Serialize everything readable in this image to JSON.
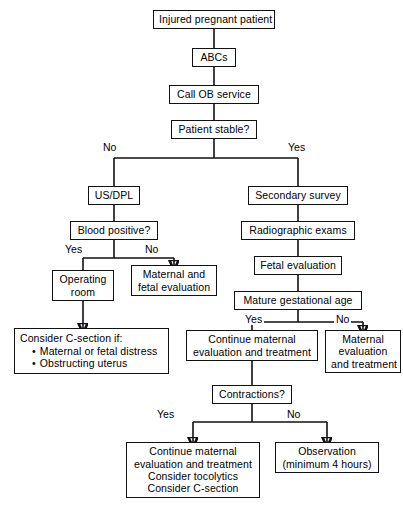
{
  "chart_data": {
    "type": "diagram",
    "orientation": "top-down",
    "background": "#ffffff",
    "line_color": "#111111",
    "nodes": [
      {
        "id": "injured",
        "label": "Injured pregnant patient",
        "lines": [
          "Injured pregnant patient"
        ],
        "x": 153,
        "y": 10,
        "w": 122,
        "h": 19
      },
      {
        "id": "abcs",
        "label": "ABCs",
        "lines": [
          "ABCs"
        ],
        "x": 192,
        "y": 48,
        "w": 44,
        "h": 19
      },
      {
        "id": "callob",
        "label": "Call OB service",
        "lines": [
          "Call OB service"
        ],
        "x": 169,
        "y": 85,
        "w": 90,
        "h": 19
      },
      {
        "id": "stable",
        "label": "Patient stable?",
        "lines": [
          "Patient stable?"
        ],
        "x": 171,
        "y": 120,
        "w": 86,
        "h": 19
      },
      {
        "id": "usdpl",
        "label": "US/DPL",
        "lines": [
          "US/DPL"
        ],
        "x": 88,
        "y": 186,
        "w": 52,
        "h": 19
      },
      {
        "id": "blood",
        "label": "Blood positive?",
        "lines": [
          "Blood positive?"
        ],
        "x": 70,
        "y": 221,
        "w": 88,
        "h": 19
      },
      {
        "id": "oproom",
        "label": "Operating room",
        "lines": [
          "Operating",
          "room"
        ],
        "x": 52,
        "y": 270,
        "w": 62,
        "h": 31
      },
      {
        "id": "matfet",
        "label": "Maternal and fetal evaluation",
        "lines": [
          "Maternal and",
          "fetal evaluation"
        ],
        "x": 131,
        "y": 265,
        "w": 86,
        "h": 31
      },
      {
        "id": "csection",
        "label": "Consider C-section if: Maternal or fetal distress; Obstructing uterus",
        "lines": [
          "Consider C-section if:"
        ],
        "bullets": [
          "Maternal or fetal distress",
          "Obstructing uterus"
        ],
        "x": 14,
        "y": 328,
        "w": 155,
        "h": 46
      },
      {
        "id": "secondary",
        "label": "Secondary survey",
        "lines": [
          "Secondary survey"
        ],
        "x": 248,
        "y": 186,
        "w": 100,
        "h": 19
      },
      {
        "id": "radio",
        "label": "Radiographic exams",
        "lines": [
          "Radiographic exams"
        ],
        "x": 241,
        "y": 221,
        "w": 114,
        "h": 19
      },
      {
        "id": "fetaleval",
        "label": "Fetal evaluation",
        "lines": [
          "Fetal evaluation"
        ],
        "x": 254,
        "y": 256,
        "w": 88,
        "h": 19
      },
      {
        "id": "mature",
        "label": "Mature gestational age",
        "lines": [
          "Mature gestational age"
        ],
        "x": 234,
        "y": 291,
        "w": 128,
        "h": 19
      },
      {
        "id": "contmat",
        "label": "Continue maternal evaluation and treatment",
        "lines": [
          "Continue maternal",
          "evaluation and treatment"
        ],
        "x": 186,
        "y": 330,
        "w": 132,
        "h": 31
      },
      {
        "id": "matevaltx",
        "label": "Maternal evaluation and treatment",
        "lines": [
          "Maternal",
          "evaluation",
          "and treatment"
        ],
        "x": 325,
        "y": 330,
        "w": 76,
        "h": 43
      },
      {
        "id": "contractions",
        "label": "Contractions?",
        "lines": [
          "Contractions?"
        ],
        "x": 212,
        "y": 385,
        "w": 80,
        "h": 19
      },
      {
        "id": "contmat2",
        "label": "Continue maternal evaluation and treatment Consider tocolytics Consider C-section",
        "lines": [
          "Continue maternal",
          "evaluation and treatment",
          "Consider tocolytics",
          "Consider C-section"
        ],
        "x": 126,
        "y": 442,
        "w": 134,
        "h": 56
      },
      {
        "id": "observation",
        "label": "Observation (minimum 4 hours)",
        "lines": [
          "Observation",
          "(minimum 4 hours)"
        ],
        "x": 275,
        "y": 442,
        "w": 104,
        "h": 31
      }
    ],
    "edge_labels": [
      {
        "id": "stable-no",
        "text": "No",
        "x": 101,
        "y": 141
      },
      {
        "id": "stable-yes",
        "text": "Yes",
        "x": 286,
        "y": 141
      },
      {
        "id": "blood-yes",
        "text": "Yes",
        "x": 63,
        "y": 243
      },
      {
        "id": "blood-no",
        "text": "No",
        "x": 143,
        "y": 243
      },
      {
        "id": "mature-yes",
        "text": "Yes",
        "x": 243,
        "y": 313
      },
      {
        "id": "mature-no",
        "text": "No",
        "x": 334,
        "y": 313
      },
      {
        "id": "contractions-yes",
        "text": "Yes",
        "x": 155,
        "y": 408
      },
      {
        "id": "contractions-no",
        "text": "No",
        "x": 285,
        "y": 408
      }
    ],
    "edges": [
      {
        "from": "injured",
        "to": "abcs",
        "path": "M214,29 L214,48",
        "arrow": false
      },
      {
        "from": "abcs",
        "to": "callob",
        "path": "M214,67 L214,85",
        "arrow": false
      },
      {
        "from": "callob",
        "to": "stable",
        "path": "M214,104 L214,120",
        "arrow": false
      },
      {
        "from": "stable",
        "to": "split",
        "path": "M214,139 L214,158",
        "arrow": false
      },
      {
        "from": "split",
        "to": "usdpl",
        "path": "M114,158 L298,158",
        "arrow": false
      },
      {
        "from": "split-left",
        "to": "usdpl",
        "path": "M114,158 L114,186",
        "arrow": false
      },
      {
        "from": "split-right",
        "to": "secondary",
        "path": "M298,158 L298,186",
        "arrow": false
      },
      {
        "from": "usdpl",
        "to": "blood",
        "path": "M114,205 L114,221",
        "arrow": false
      },
      {
        "from": "blood",
        "to": "bsplit",
        "path": "M114,240 L114,258",
        "arrow": false
      },
      {
        "from": "bsplit",
        "to": "bar",
        "path": "M83,258 L174,258",
        "arrow": false
      },
      {
        "from": "bar-left",
        "to": "oproom",
        "path": "M83,258 L83,270",
        "arrow": false
      },
      {
        "from": "bar-right",
        "to": "matfet",
        "path": "M174,258 L174,265",
        "arrow": true
      },
      {
        "from": "oproom",
        "to": "csection",
        "path": "M83,301 L83,328",
        "arrow": true
      },
      {
        "from": "secondary",
        "to": "radio",
        "path": "M298,205 L298,221",
        "arrow": false
      },
      {
        "from": "radio",
        "to": "fetaleval",
        "path": "M298,240 L298,256",
        "arrow": false
      },
      {
        "from": "fetaleval",
        "to": "mature",
        "path": "M298,275 L298,291",
        "arrow": false
      },
      {
        "from": "mature",
        "to": "msplit",
        "path": "M298,310 L298,322",
        "arrow": false
      },
      {
        "from": "msplit",
        "to": "mbar",
        "path": "M252,322 L363,322",
        "arrow": false
      },
      {
        "from": "mbar-left",
        "to": "contmat",
        "path": "M252,322 L252,330",
        "arrow": false
      },
      {
        "from": "mbar-right",
        "to": "matevaltx",
        "path": "M363,322 L363,330",
        "arrow": true
      },
      {
        "from": "contmat",
        "to": "contractions",
        "path": "M252,361 L252,385",
        "arrow": false
      },
      {
        "from": "contractions",
        "to": "csplit",
        "path": "M252,404 L252,422",
        "arrow": false
      },
      {
        "from": "csplit",
        "to": "cbar",
        "path": "M193,422 L327,422",
        "arrow": false
      },
      {
        "from": "cbar-left",
        "to": "contmat2",
        "path": "M193,422 L193,442",
        "arrow": true
      },
      {
        "from": "cbar-right",
        "to": "observation",
        "path": "M327,422 L327,442",
        "arrow": true
      }
    ]
  }
}
